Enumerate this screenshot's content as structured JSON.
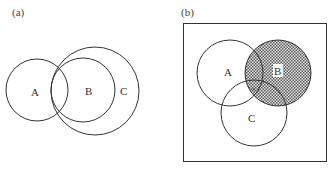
{
  "panel_a": {
    "caption": "(a)",
    "labels": {
      "a": "A",
      "b": "B",
      "c": "C"
    }
  },
  "panel_b": {
    "caption": "(b)",
    "labels": {
      "a": "A",
      "b": "B",
      "c": "C",
      "x": "×"
    },
    "shaded_region": "B"
  }
}
